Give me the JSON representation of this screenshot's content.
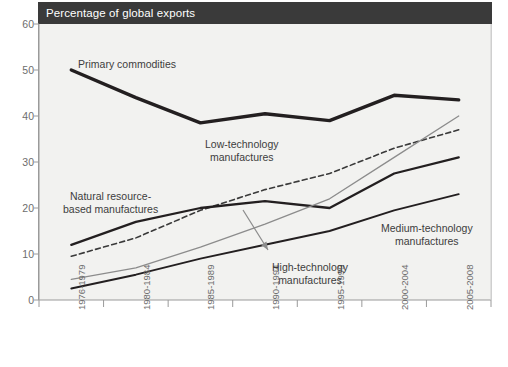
{
  "header": {
    "title": "Percentage of global exports"
  },
  "chart_data": {
    "type": "line",
    "title": "Percentage of global exports",
    "xlabel": "",
    "ylabel": "Percentage of global exports",
    "ylim": [
      0,
      60
    ],
    "yticks": [
      0,
      10,
      20,
      30,
      40,
      50,
      60
    ],
    "grid": false,
    "legend_position": "inline-annotations",
    "categories": [
      "1976-1979",
      "1980-1984",
      "1985-1989",
      "1990-1994",
      "1995-1999",
      "2000-2004",
      "2005-2008"
    ],
    "series": [
      {
        "name": "Primary commodities",
        "style": "solid-thick",
        "color": "#231f20",
        "width": 3.4,
        "values": [
          50.0,
          44.0,
          38.5,
          40.5,
          39.0,
          44.5,
          43.5
        ]
      },
      {
        "name": "Low-technology manufactures",
        "style": "dashed",
        "color": "#3a3a3a",
        "width": 1.6,
        "values": [
          9.5,
          13.5,
          19.5,
          24.0,
          27.5,
          33.0,
          37.0
        ]
      },
      {
        "name": "Natural resource-based manufactures",
        "style": "solid-medium",
        "color": "#231f20",
        "width": 2.3,
        "values": [
          12.0,
          17.0,
          20.0,
          21.5,
          20.0,
          27.5,
          31.0
        ]
      },
      {
        "name": "High-technology manufactures",
        "style": "solid-thin-gray",
        "color": "#8c8c8c",
        "width": 1.3,
        "values": [
          4.5,
          7.0,
          11.5,
          16.5,
          22.0,
          31.0,
          40.0
        ]
      },
      {
        "name": "Medium-technology manufactures",
        "style": "solid-thin",
        "color": "#231f20",
        "width": 1.9,
        "values": [
          2.5,
          5.5,
          9.0,
          12.0,
          15.0,
          19.5,
          23.0
        ]
      }
    ],
    "annotations": [
      {
        "name": "primary-commodities-label",
        "text": "Primary commodities",
        "x_px": 78,
        "y_px": 58
      },
      {
        "name": "low-technology-label",
        "line1": "Low-technology",
        "line2": "manufactures",
        "x_px": 205,
        "y_px": 138
      },
      {
        "name": "natural-resource-label",
        "line1": "Natural resource-",
        "line2": "based manufactures",
        "x_px": 63,
        "y_px": 190
      },
      {
        "name": "high-technology-label",
        "line1": "High-technology",
        "line2": "manufactures",
        "x_px": 272,
        "y_px": 261
      },
      {
        "name": "medium-technology-label",
        "line1": "Medium-technology",
        "line2": "manufactures",
        "x_px": 381,
        "y_px": 222
      }
    ],
    "arrow": {
      "name": "high-technology-arrow",
      "from": [
        243,
        210
      ],
      "to": [
        268,
        250
      ],
      "color": "#8c8c8c"
    }
  },
  "colors": {
    "title_bar_bg": "#3a3a3a",
    "title_bar_text": "#ffffff",
    "plot_bg": "#f2f2f0",
    "axis": "#9a9a9a",
    "tick_text": "#6d6d6d",
    "label_text": "#3d3d3d"
  }
}
